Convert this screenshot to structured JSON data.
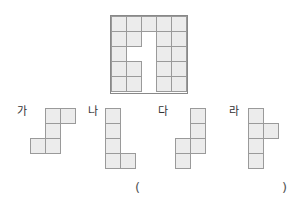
{
  "board": {
    "rows": 5,
    "cols": 5,
    "missing_cells": [
      [
        1,
        2
      ],
      [
        2,
        1
      ],
      [
        2,
        2
      ],
      [
        3,
        2
      ],
      [
        4,
        2
      ]
    ]
  },
  "options": [
    {
      "label": "가",
      "cells": [
        [
          0,
          1
        ],
        [
          0,
          2
        ],
        [
          1,
          1
        ],
        [
          2,
          0
        ],
        [
          2,
          1
        ]
      ]
    },
    {
      "label": "나",
      "cells": [
        [
          0,
          0
        ],
        [
          1,
          0
        ],
        [
          2,
          0
        ],
        [
          3,
          0
        ],
        [
          3,
          1
        ]
      ]
    },
    {
      "label": "다",
      "cells": [
        [
          0,
          1
        ],
        [
          1,
          1
        ],
        [
          2,
          1
        ],
        [
          2,
          0
        ],
        [
          3,
          0
        ]
      ]
    },
    {
      "label": "라",
      "cells": [
        [
          0,
          0
        ],
        [
          1,
          0
        ],
        [
          1,
          1
        ],
        [
          2,
          0
        ],
        [
          3,
          0
        ]
      ]
    }
  ],
  "answer": {
    "open": "(",
    "close": ")"
  },
  "colors": {
    "cell_fill": "#ececec",
    "cell_border": "#9a9a9a"
  }
}
